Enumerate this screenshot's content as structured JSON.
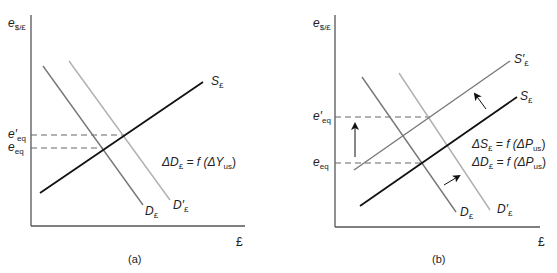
{
  "panels": [
    {
      "id": "a",
      "caption": "(a)",
      "y_axis_label": {
        "symbol": "e",
        "sub": "$/£"
      },
      "x_axis_label": "£",
      "levels": [
        {
          "name": "e'eq",
          "symbol": "e",
          "prime": "′",
          "sub": "eq",
          "y": 135
        },
        {
          "name": "eeq",
          "symbol": "e",
          "prime": "",
          "sub": "eq",
          "y": 148
        }
      ],
      "curves": [
        {
          "name": "S£",
          "label": "S",
          "prime": "",
          "sub": "£",
          "color": "#111111"
        },
        {
          "name": "D£",
          "label": "D",
          "prime": "",
          "sub": "£",
          "color": "#777777"
        },
        {
          "name": "D'£",
          "label": "D",
          "prime": "′",
          "sub": "£",
          "color": "#b0b0b0"
        }
      ],
      "annotations": [
        {
          "text_parts": [
            "ΔD",
            "£",
            " = f (ΔY",
            "us",
            ")"
          ]
        }
      ]
    },
    {
      "id": "b",
      "caption": "(b)",
      "y_axis_label": {
        "symbol": "e",
        "sub": "$/£"
      },
      "x_axis_label": "£",
      "levels": [
        {
          "name": "e'eq",
          "symbol": "e",
          "prime": "′",
          "sub": "eq",
          "y": 117
        },
        {
          "name": "eeq",
          "symbol": "e",
          "prime": "",
          "sub": "eq",
          "y": 163
        }
      ],
      "curves": [
        {
          "name": "S'£",
          "label": "S",
          "prime": "′",
          "sub": "£",
          "color": "#777777"
        },
        {
          "name": "S£",
          "label": "S",
          "prime": "",
          "sub": "£",
          "color": "#111111"
        },
        {
          "name": "D£",
          "label": "D",
          "prime": "",
          "sub": "£",
          "color": "#777777"
        },
        {
          "name": "D'£",
          "label": "D",
          "prime": "′",
          "sub": "£",
          "color": "#b0b0b0"
        }
      ],
      "annotations": [
        {
          "text_parts": [
            "ΔS",
            "£",
            " = f (ΔP",
            "us",
            ")"
          ]
        },
        {
          "text_parts": [
            "ΔD",
            "£",
            " = f (ΔP",
            "us",
            ")"
          ]
        }
      ],
      "arrows": [
        "supply-shift-up",
        "demand-shift-right",
        "equilibrium-rise"
      ]
    }
  ]
}
